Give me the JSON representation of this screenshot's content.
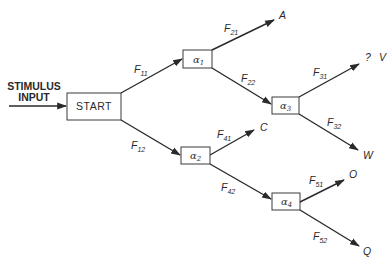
{
  "diagram": {
    "input_label": [
      "STIMULUS",
      "INPUT"
    ],
    "start": {
      "label": "START"
    },
    "nodes": [
      {
        "id": "a1",
        "symbol": "α",
        "sub": "1"
      },
      {
        "id": "a2",
        "symbol": "α",
        "sub": "2"
      },
      {
        "id": "a3",
        "symbol": "α",
        "sub": "3"
      },
      {
        "id": "a4",
        "symbol": "α",
        "sub": "4"
      }
    ],
    "edges": [
      {
        "from": "START",
        "to": "a1",
        "label": "F",
        "sub": "11"
      },
      {
        "from": "START",
        "to": "a2",
        "label": "F",
        "sub": "12"
      },
      {
        "from": "a1",
        "to": "A",
        "label": "F",
        "sub": "21"
      },
      {
        "from": "a1",
        "to": "a3",
        "label": "F",
        "sub": "22"
      },
      {
        "from": "a3",
        "to": "V",
        "label": "F",
        "sub": "31"
      },
      {
        "from": "a3",
        "to": "W",
        "label": "F",
        "sub": "32"
      },
      {
        "from": "a2",
        "to": "C",
        "label": "F",
        "sub": "41"
      },
      {
        "from": "a2",
        "to": "a4",
        "label": "F",
        "sub": "42"
      },
      {
        "from": "a4",
        "to": "O",
        "label": "F",
        "sub": "51"
      },
      {
        "from": "a4",
        "to": "Q",
        "label": "F",
        "sub": "52"
      }
    ],
    "outputs": {
      "A": "A",
      "V_prefix": "?",
      "V": "V",
      "W": "W",
      "C": "C",
      "O": "O",
      "Q": "Q"
    }
  }
}
